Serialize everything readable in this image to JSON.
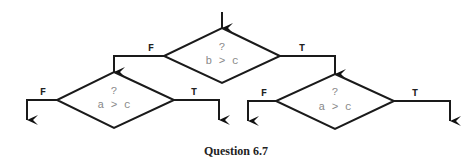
{
  "diagram": {
    "type": "flowchart",
    "nodes": [
      {
        "id": "top",
        "question": "?",
        "condition": "b > c"
      },
      {
        "id": "left",
        "question": "?",
        "condition": "a > c"
      },
      {
        "id": "right",
        "question": "?",
        "condition": "a > c"
      }
    ],
    "edges": [
      {
        "from": "top",
        "to": "left",
        "label": "F"
      },
      {
        "from": "top",
        "to": "right",
        "label": "T"
      },
      {
        "from": "left",
        "to": "out1",
        "label": "F"
      },
      {
        "from": "left",
        "to": "out2",
        "label": "T"
      },
      {
        "from": "right",
        "to": "out3",
        "label": "F"
      },
      {
        "from": "right",
        "to": "out4",
        "label": "T"
      }
    ],
    "caption": "Question 6.7"
  }
}
